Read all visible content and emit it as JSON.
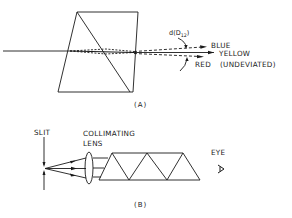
{
  "figure_a": {
    "caption": "(A)",
    "angle_label_prefix": "d(D",
    "angle_label_sub": "12",
    "angle_label_suffix": ")",
    "rays": {
      "blue": "BLUE",
      "yellow": "YELLOW",
      "red": "RED",
      "undeviated": "(UNDEVIATED)"
    }
  },
  "figure_b": {
    "caption": "(B)",
    "slit": "SLIT",
    "lens_line1": "COLLIMATING",
    "lens_line2": "LENS",
    "eye": "EYE"
  },
  "colors": {
    "line": "#1a1a1a",
    "background": "#ffffff"
  }
}
